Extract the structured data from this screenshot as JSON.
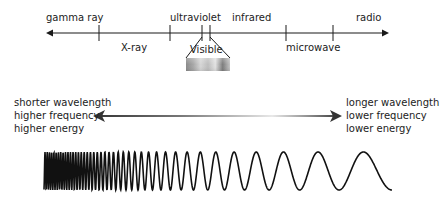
{
  "spectrum_axis": {
    "labels_above": [
      {
        "text": "gamma ray",
        "x": 46,
        "y": 12
      },
      {
        "text": "ultraviolet",
        "x": 170,
        "y": 12
      },
      {
        "text": "infrared",
        "x": 232,
        "y": 12
      },
      {
        "text": "radio",
        "x": 356,
        "y": 12
      }
    ],
    "labels_below": [
      {
        "text": "X-ray",
        "x": 121,
        "y": 42
      },
      {
        "text": "Visible",
        "x": 190,
        "y": 44
      },
      {
        "text": "microwave",
        "x": 286,
        "y": 42
      }
    ],
    "ticks_x": [
      99,
      170,
      202,
      210,
      286,
      333
    ],
    "line": {
      "x1": 46,
      "x2": 389,
      "y": 33
    },
    "color": "#1a1a1a"
  },
  "visible_band": {
    "label": "Visible",
    "bar": {
      "x": 186,
      "y": 58,
      "w": 44,
      "h": 13
    },
    "gradient_stops": [
      "#8a8a8a",
      "#a8a8a8",
      "#d6d6d6",
      "#bdbdbd",
      "#e2e2e2",
      "#7d7d7d",
      "#c4c4c4"
    ]
  },
  "properties": {
    "left": [
      "shorter wavelength",
      "higher frequency",
      "higher energy"
    ],
    "right": [
      "longer wavelength",
      "lower frequency",
      "lower energy"
    ],
    "arrow": {
      "x1": 93,
      "x2": 342,
      "y": 116,
      "dark": "#333333",
      "light": "#e8e8e8"
    }
  },
  "wave": {
    "x_start": 44,
    "x_end": 392,
    "center_y": 171,
    "amplitude": 19,
    "period_start": 2.2,
    "period_end": 62,
    "stroke": "#111111",
    "stroke_width": 1.6
  }
}
